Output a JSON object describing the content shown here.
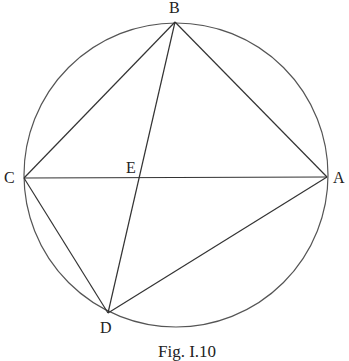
{
  "diagram": {
    "type": "geometry",
    "circle": {
      "cx": 176,
      "cy": 175,
      "r": 152
    },
    "points": {
      "A": {
        "label": "A",
        "x": 327,
        "y": 177
      },
      "B": {
        "label": "B",
        "x": 175,
        "y": 22
      },
      "C": {
        "label": "C",
        "x": 24,
        "y": 178
      },
      "D": {
        "label": "D",
        "x": 108,
        "y": 313
      },
      "E": {
        "label": "E",
        "x": 140,
        "y": 178
      }
    },
    "segments": [
      "AB",
      "BC",
      "CA",
      "CD",
      "DA",
      "BD"
    ],
    "caption": "Fig. I.10"
  }
}
